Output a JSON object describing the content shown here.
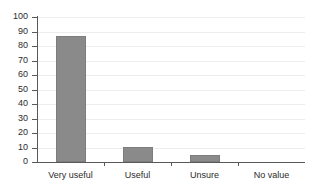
{
  "chart_data": {
    "type": "bar",
    "title": "",
    "subtitle": "",
    "xlabel": "",
    "ylabel": "",
    "categories": [
      "Very useful",
      "Useful",
      "Unsure",
      "No value"
    ],
    "values": [
      87,
      10.5,
      5,
      0
    ],
    "series": [
      {
        "name": "Responses",
        "values": [
          87,
          10.5,
          5,
          0
        ]
      }
    ],
    "ylim": [
      0,
      100
    ],
    "y_ticks": [
      0,
      10,
      20,
      30,
      40,
      50,
      60,
      70,
      80,
      90,
      100
    ],
    "y_tick_labels": [
      "0",
      "10",
      "20",
      "30",
      "40",
      "50",
      "60",
      "70",
      "80",
      "90",
      "100"
    ],
    "grid": true,
    "grid_axis": "y",
    "legend": false,
    "legend_position": "none",
    "bar_color": "#8a8a8a",
    "grid_color": "#ededed",
    "axis_color": "#595959",
    "background_color": "#ffffff",
    "annotations": []
  }
}
